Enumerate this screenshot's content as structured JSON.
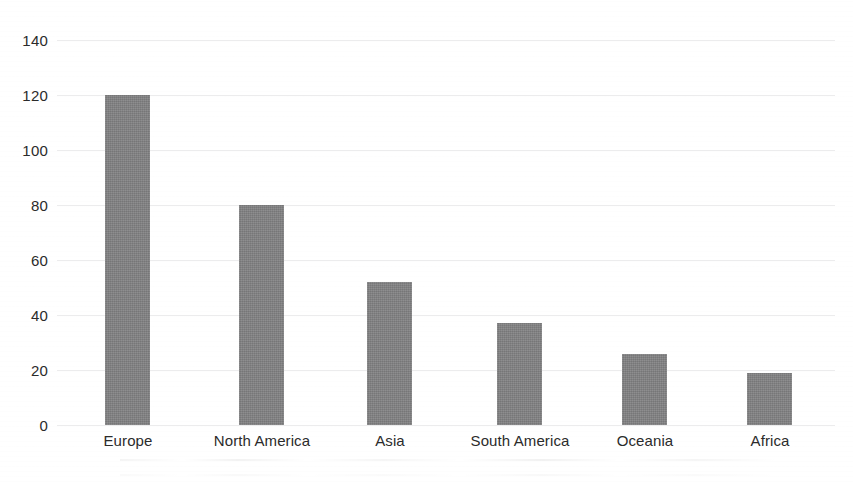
{
  "chart_data": {
    "type": "bar",
    "title": "",
    "subtitle": "",
    "xlabel": "",
    "ylabel": "",
    "categories": [
      "Europe",
      "North America",
      "Asia",
      "South America",
      "Oceania",
      "Africa"
    ],
    "values": [
      120,
      80,
      52,
      37,
      26,
      19
    ],
    "ylim": [
      0,
      140
    ],
    "ytick_labels": [
      "140",
      "120",
      "100",
      "80",
      "60",
      "40",
      "20",
      "0"
    ],
    "ytick_values": [
      140,
      120,
      100,
      80,
      60,
      40,
      20,
      0
    ],
    "grid": true,
    "grid_axis": "y",
    "legend": false,
    "legend_position": "none",
    "bar_color": "#818182",
    "grid_color": "#ececed",
    "text_color": "#2b2b2b",
    "background_color": "#ffffff",
    "annotations": []
  },
  "axes": {
    "y": {
      "ticks": [
        {
          "label": "140",
          "value": 140
        },
        {
          "label": "120",
          "value": 120
        },
        {
          "label": "100",
          "value": 100
        },
        {
          "label": "80",
          "value": 80
        },
        {
          "label": "60",
          "value": 60
        },
        {
          "label": "40",
          "value": 40
        },
        {
          "label": "20",
          "value": 20
        },
        {
          "label": "0",
          "value": 0
        }
      ]
    },
    "x": {
      "ticks": [
        {
          "label": "Europe",
          "center": 128
        },
        {
          "label": "North America",
          "center": 262
        },
        {
          "label": "Asia",
          "center": 390
        },
        {
          "label": "South America",
          "center": 520
        },
        {
          "label": "Oceania",
          "center": 645
        },
        {
          "label": "Africa",
          "center": 770
        }
      ]
    }
  },
  "bars": [
    {
      "label": "Europe",
      "value": 120,
      "left": 105
    },
    {
      "label": "North America",
      "value": 80,
      "left": 239
    },
    {
      "label": "Asia",
      "value": 52,
      "left": 367
    },
    {
      "label": "South America",
      "value": 37,
      "left": 497
    },
    {
      "label": "Oceania",
      "value": 26,
      "left": 622
    },
    {
      "label": "Africa",
      "value": 19,
      "left": 747
    }
  ]
}
